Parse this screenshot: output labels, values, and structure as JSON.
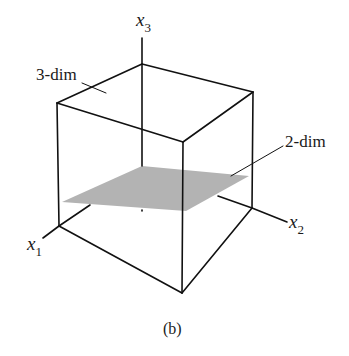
{
  "figure": {
    "caption": "(b)",
    "axes": {
      "x1": {
        "label": "x",
        "sub": "1"
      },
      "x2": {
        "label": "x",
        "sub": "2"
      },
      "x3": {
        "label": "x",
        "sub": "3"
      }
    },
    "annotations": {
      "cube": "3-dim",
      "plane": "2-dim"
    },
    "colors": {
      "line": "#111111",
      "plane": "#b3b3b3",
      "background": "#ffffff"
    }
  }
}
